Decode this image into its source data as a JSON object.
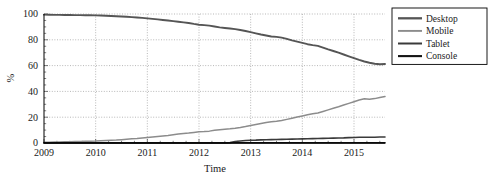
{
  "chart_data": {
    "type": "line",
    "title": "",
    "xlabel": "Time",
    "ylabel": "%",
    "xlim": [
      2009.0,
      2015.6
    ],
    "ylim": [
      0,
      100
    ],
    "xticks": [
      "2009",
      "2010",
      "2011",
      "2012",
      "2013",
      "2014",
      "2015"
    ],
    "xtick_values": [
      2009,
      2010,
      2011,
      2012,
      2013,
      2014,
      2015
    ],
    "yticks": [
      "0",
      "20",
      "40",
      "60",
      "80",
      "100"
    ],
    "ytick_values": [
      0,
      20,
      40,
      60,
      80,
      100
    ],
    "grid": true,
    "legend_position": "upper-right",
    "x": [
      2009.0,
      2009.1,
      2009.2,
      2009.3,
      2009.4,
      2009.5,
      2009.6,
      2009.7,
      2009.8,
      2009.9,
      2010.0,
      2010.1,
      2010.2,
      2010.3,
      2010.4,
      2010.5,
      2010.6,
      2010.7,
      2010.8,
      2010.9,
      2011.0,
      2011.1,
      2011.2,
      2011.3,
      2011.4,
      2011.5,
      2011.6,
      2011.7,
      2011.8,
      2011.9,
      2012.0,
      2012.1,
      2012.2,
      2012.3,
      2012.4,
      2012.5,
      2012.6,
      2012.7,
      2012.8,
      2012.9,
      2013.0,
      2013.1,
      2013.2,
      2013.3,
      2013.4,
      2013.5,
      2013.6,
      2013.7,
      2013.8,
      2013.9,
      2014.0,
      2014.1,
      2014.2,
      2014.3,
      2014.4,
      2014.5,
      2014.6,
      2014.7,
      2014.8,
      2014.9,
      2015.0,
      2015.1,
      2015.2,
      2015.3,
      2015.4,
      2015.5,
      2015.6
    ],
    "series": [
      {
        "name": "Desktop",
        "color": "#555555",
        "width": 1.9,
        "values": [
          99.5,
          99.4,
          99.3,
          99.3,
          99.2,
          99.2,
          99.1,
          99.1,
          99.0,
          99.0,
          98.9,
          98.8,
          98.7,
          98.5,
          98.3,
          98.1,
          97.9,
          97.6,
          97.3,
          97.0,
          96.6,
          96.2,
          95.8,
          95.4,
          95.0,
          94.5,
          94.0,
          93.5,
          93.0,
          92.3,
          91.7,
          91.4,
          91.0,
          90.3,
          89.6,
          89.2,
          88.8,
          88.3,
          87.6,
          86.8,
          85.9,
          85.0,
          84.1,
          83.3,
          82.6,
          82.3,
          81.7,
          80.7,
          79.6,
          78.6,
          77.6,
          76.6,
          75.9,
          75.3,
          74.0,
          72.6,
          71.3,
          70.0,
          68.6,
          67.2,
          65.8,
          64.4,
          63.2,
          62.2,
          61.4,
          61.0,
          61.2
        ]
      },
      {
        "name": "Mobile",
        "color": "#8c8c8c",
        "width": 1.5,
        "values": [
          0.5,
          0.6,
          0.7,
          0.8,
          0.9,
          1.0,
          1.1,
          1.2,
          1.3,
          1.4,
          1.5,
          1.7,
          1.9,
          2.1,
          2.3,
          2.6,
          2.9,
          3.2,
          3.5,
          3.9,
          4.3,
          4.7,
          5.1,
          5.5,
          5.9,
          6.4,
          6.9,
          7.3,
          7.7,
          8.2,
          8.7,
          8.9,
          9.2,
          9.8,
          10.3,
          10.7,
          11.0,
          11.5,
          12.1,
          12.8,
          13.6,
          14.4,
          15.2,
          15.9,
          16.5,
          16.8,
          17.4,
          18.3,
          19.2,
          20.1,
          21.0,
          21.9,
          22.6,
          23.2,
          24.4,
          25.7,
          26.9,
          28.1,
          29.4,
          30.7,
          32.0,
          33.3,
          34.3,
          34.0,
          34.4,
          35.2,
          36.0
        ]
      },
      {
        "name": "Tablet",
        "color": "#3a3a3a",
        "width": 1.6,
        "values": [
          0.0,
          0.0,
          0.0,
          0.0,
          0.0,
          0.0,
          0.0,
          0.0,
          0.0,
          0.0,
          0.0,
          0.0,
          0.0,
          0.0,
          0.0,
          0.0,
          0.0,
          0.0,
          0.0,
          0.0,
          0.0,
          0.0,
          0.0,
          0.0,
          0.0,
          0.0,
          0.0,
          0.0,
          0.0,
          0.0,
          0.0,
          0.0,
          0.0,
          0.0,
          0.0,
          0.0,
          0.3,
          1.1,
          1.6,
          1.9,
          2.1,
          2.2,
          2.4,
          2.5,
          2.6,
          2.7,
          2.8,
          2.9,
          3.0,
          3.1,
          3.2,
          3.3,
          3.4,
          3.5,
          3.6,
          3.7,
          3.8,
          3.9,
          4.0,
          4.2,
          4.3,
          4.4,
          4.5,
          4.4,
          4.5,
          4.6,
          4.7
        ]
      },
      {
        "name": "Console",
        "color": "#141414",
        "width": 1.7,
        "values": [
          0.05,
          0.05,
          0.05,
          0.05,
          0.05,
          0.05,
          0.05,
          0.05,
          0.05,
          0.05,
          0.05,
          0.05,
          0.05,
          0.05,
          0.05,
          0.05,
          0.05,
          0.05,
          0.05,
          0.05,
          0.06,
          0.06,
          0.06,
          0.06,
          0.06,
          0.06,
          0.06,
          0.06,
          0.06,
          0.06,
          0.07,
          0.07,
          0.07,
          0.07,
          0.07,
          0.07,
          0.07,
          0.07,
          0.07,
          0.07,
          0.08,
          0.08,
          0.08,
          0.08,
          0.08,
          0.08,
          0.08,
          0.08,
          0.08,
          0.08,
          0.09,
          0.09,
          0.09,
          0.09,
          0.09,
          0.09,
          0.09,
          0.09,
          0.09,
          0.09,
          0.1,
          0.1,
          0.1,
          0.1,
          0.1,
          0.1,
          0.1
        ]
      }
    ]
  },
  "legend": {
    "items": [
      {
        "label": "Desktop"
      },
      {
        "label": "Mobile"
      },
      {
        "label": "Tablet"
      },
      {
        "label": "Console"
      }
    ]
  }
}
